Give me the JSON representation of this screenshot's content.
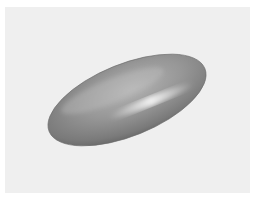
{
  "scene": {
    "subject": "3D rendered ellipsoid",
    "background_color": "#efefef",
    "object_color": "#8c8c8c",
    "ellipsoid": {
      "cx": 127,
      "cy": 100,
      "rx": 84,
      "ry": 36,
      "rotation_deg": -22
    }
  }
}
